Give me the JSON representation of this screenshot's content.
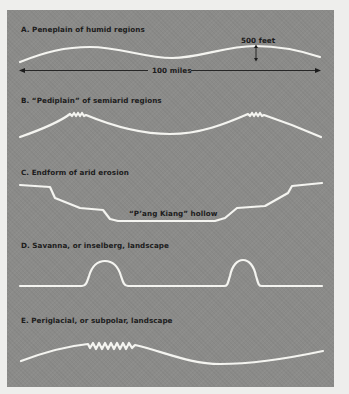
{
  "figure": {
    "background_color": "#eeeeec",
    "panel_color": "#8b8b89",
    "profile_color": "#f4f4f0",
    "text_color": "#1c1c1c"
  },
  "panels": [
    {
      "id": "A",
      "title": "A. Peneplain of humid regions",
      "annotations": {
        "vertical_scale": "500 feet",
        "horizontal_scale": "100 miles"
      }
    },
    {
      "id": "B",
      "title": "B. “Pediplain” of semiarid regions"
    },
    {
      "id": "C",
      "title": "C. Endform of arid erosion",
      "annotations": {
        "hollow_label": "“P’ang Kiang” hollow"
      }
    },
    {
      "id": "D",
      "title": "D. Savanna, or inselberg, landscape"
    },
    {
      "id": "E",
      "title": "E. Periglacial, or subpolar, landscape"
    }
  ]
}
